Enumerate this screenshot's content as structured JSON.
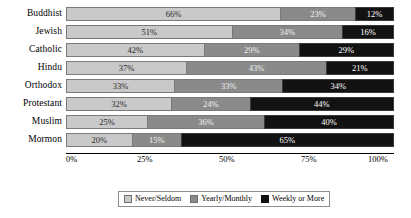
{
  "chart_data": {
    "type": "bar",
    "orientation": "horizontal",
    "stacked": true,
    "normalized": true,
    "title": "",
    "subtitle": "",
    "xlabel": "",
    "ylabel": "",
    "xlim": [
      0,
      100
    ],
    "xticks": [
      "0%",
      "25%",
      "50%",
      "75%",
      "100%"
    ],
    "xtick_values": [
      0,
      25,
      50,
      75,
      100
    ],
    "grid": false,
    "legend_position": "bottom",
    "categories": [
      "Buddhist",
      "Jewish",
      "Catholic",
      "Hindu",
      "Orthodox",
      "Protestant",
      "Muslim",
      "Mormon"
    ],
    "series": [
      {
        "name": "Never/Seldom",
        "color": "#c9c9c9",
        "values": [
          66,
          51,
          42,
          37,
          33,
          32,
          25,
          20
        ],
        "labels": [
          "66%",
          "51%",
          "42%",
          "37%",
          "33%",
          "32%",
          "25%",
          "20%"
        ]
      },
      {
        "name": "Yearly/Monthly",
        "color": "#8a8a8a",
        "values": [
          23,
          34,
          29,
          43,
          33,
          24,
          36,
          15
        ],
        "labels": [
          "23%",
          "34%",
          "29%",
          "43%",
          "33%",
          "24%",
          "36%",
          "15%"
        ]
      },
      {
        "name": "Weekly or More",
        "color": "#121212",
        "values": [
          12,
          16,
          29,
          21,
          34,
          44,
          40,
          65
        ],
        "labels": [
          "12%",
          "16%",
          "29%",
          "21%",
          "34%",
          "44%",
          "40%",
          "65%"
        ]
      }
    ]
  },
  "legend": {
    "items": [
      {
        "label": "Never/Seldom",
        "swatch": "s0"
      },
      {
        "label": "Yearly/Monthly",
        "swatch": "s1"
      },
      {
        "label": "Weekly or More",
        "swatch": "s2"
      }
    ]
  }
}
